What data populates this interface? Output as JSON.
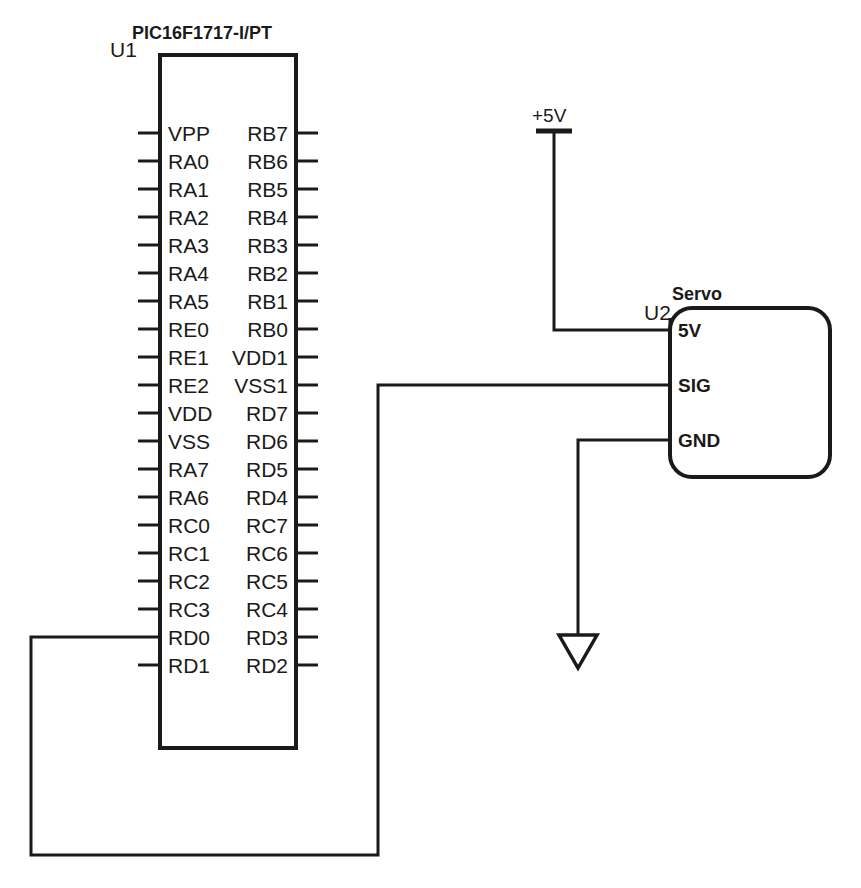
{
  "diagram": {
    "background_color": "#ffffff",
    "line_color": "#1a1a1a"
  },
  "mcu": {
    "part_number": "PIC16F1717-I/PT",
    "reference": "U1",
    "left_pins": [
      "VPP",
      "RA0",
      "RA1",
      "RA2",
      "RA3",
      "RA4",
      "RA5",
      "RE0",
      "RE1",
      "RE2",
      "VDD",
      "VSS",
      "RA7",
      "RA6",
      "RC0",
      "RC1",
      "RC2",
      "RC3",
      "RD0",
      "RD1"
    ],
    "right_pins": [
      "RB7",
      "RB6",
      "RB5",
      "RB4",
      "RB3",
      "RB2",
      "RB1",
      "RB0",
      "VDD1",
      "VSS1",
      "RD7",
      "RD6",
      "RD5",
      "RD4",
      "RC7",
      "RC6",
      "RC5",
      "RC4",
      "RD3",
      "RD2"
    ]
  },
  "servo": {
    "part_title": "Servo",
    "reference": "U2",
    "pins": [
      "5V",
      "SIG",
      "GND"
    ]
  },
  "power": {
    "rail_label": "+5V",
    "ground_symbol": "ground-triangle"
  },
  "nets": [
    {
      "name": "net-5v-to-servo-5v",
      "from": "+5V rail",
      "to": "U2 pin 5V"
    },
    {
      "name": "net-rd0-to-servo-sig",
      "from": "U1 pin RD0",
      "to": "U2 pin SIG"
    },
    {
      "name": "net-servo-gnd-to-ground",
      "from": "U2 pin GND",
      "to": "ground-triangle"
    }
  ]
}
